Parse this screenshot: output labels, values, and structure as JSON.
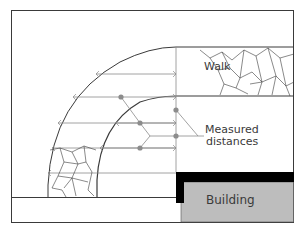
{
  "diagram": {
    "labels": {
      "walk": "Walk",
      "measured_line1": "Measured",
      "measured_line2": "distances",
      "building": "Building"
    },
    "colors": {
      "line": "#3a3a3a",
      "thin_line": "#8a8a8a",
      "dot": "#8c8c8c",
      "building_fill": "#bdbdbd",
      "building_wall": "#000000",
      "background": "#ffffff"
    }
  }
}
